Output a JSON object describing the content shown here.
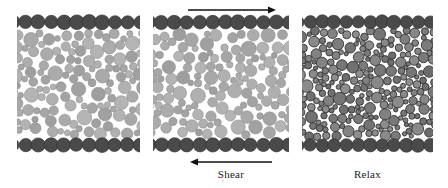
{
  "figure": {
    "background_color": "#ffffff",
    "width": 448,
    "height": 188
  },
  "colors": {
    "wall_particle": "#4a4a4a",
    "wall_particle_edge": "#333333",
    "bulk_particle_light": "#a8a8a8",
    "bulk_particle_light_edge": "#8f8f8f",
    "bulk_particle_dark": "#7d7d7d",
    "bulk_particle_dark_edge": "#2e2e2e",
    "void_color": "#ffffff",
    "arrow_color": "#111111",
    "label_color": "#1c1c1c",
    "panel_border": "#d8d8d8"
  },
  "panels": [
    {
      "id": "panel-initial",
      "name": "initial-configuration",
      "index": 1,
      "x": 17,
      "y": 14,
      "width": 123,
      "height": 139,
      "particle_style": "light",
      "packing": "loose",
      "wall_rows": [
        "top",
        "bottom"
      ],
      "caption": "",
      "arrow_top": false,
      "arrow_bottom": false
    },
    {
      "id": "panel-shear",
      "name": "sheared-configuration",
      "index": 2,
      "x": 153,
      "y": 14,
      "width": 136,
      "height": 139,
      "particle_style": "light",
      "packing": "loose",
      "wall_rows": [
        "top",
        "bottom"
      ],
      "caption": "Shear",
      "arrow_top": true,
      "arrow_bottom": true
    },
    {
      "id": "panel-relax",
      "name": "relaxed-configuration",
      "index": 3,
      "x": 302,
      "y": 14,
      "width": 131,
      "height": 139,
      "particle_style": "dark",
      "packing": "dense",
      "wall_rows": [
        "top",
        "bottom"
      ],
      "caption": "Relax",
      "arrow_top": false,
      "arrow_bottom": false
    }
  ],
  "arrows": {
    "top_shear": {
      "label": "shear-arrow-top",
      "direction": "right",
      "x": 188,
      "y": 5,
      "length": 88
    },
    "bottom_shear": {
      "label": "shear-arrow-bottom",
      "direction": "left",
      "x": 190,
      "y": 157,
      "length": 82
    }
  },
  "labels": {
    "shear": "Shear",
    "relax": "Relax"
  },
  "chart_data": {
    "type": "diagram",
    "panels": [
      {
        "index": 1,
        "label": "",
        "state": "initial",
        "particle_shade": "light gray",
        "void_fraction_qualitative": "high",
        "bulk_particle_count_approx": 78,
        "wall_particle_count_top": 11,
        "wall_particle_count_bottom": 11
      },
      {
        "index": 2,
        "label": "Shear",
        "state": "sheared",
        "particle_shade": "light gray",
        "void_fraction_qualitative": "high",
        "bulk_particle_count_approx": 84,
        "wall_particle_count_top": 12,
        "wall_particle_count_bottom": 12
      },
      {
        "index": 3,
        "label": "Relax",
        "state": "relaxed",
        "particle_shade": "medium gray with dark outlines",
        "void_fraction_qualitative": "low",
        "bulk_particle_count_approx": 118,
        "wall_particle_count_top": 11,
        "wall_particle_count_bottom": 11
      }
    ],
    "annotations": [
      {
        "text": "Shear",
        "position": "below middle panel",
        "arrow": "left"
      },
      {
        "text": "",
        "position": "above middle panel",
        "arrow": "right"
      },
      {
        "text": "Relax",
        "position": "below right panel",
        "arrow": "none"
      }
    ]
  }
}
